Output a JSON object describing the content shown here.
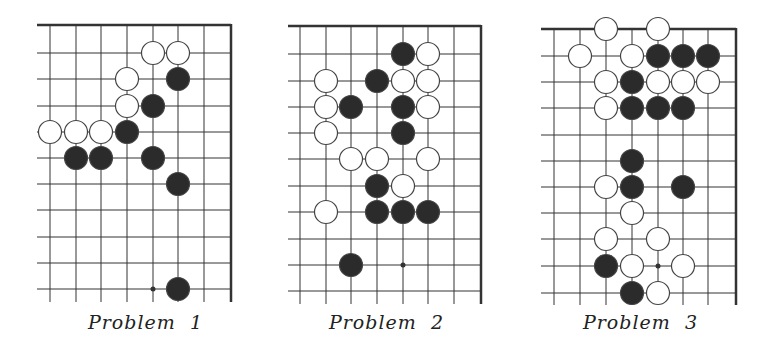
{
  "boards": [
    {
      "label": "Problem  1",
      "origin": [
        37,
        25
      ],
      "cols_x": [
        50,
        76,
        101,
        127,
        153,
        178,
        204
      ],
      "right_edge": 231,
      "rows_y": [
        25,
        53,
        79,
        106,
        132,
        158,
        184,
        210,
        237,
        263,
        289
      ],
      "bottom": 302,
      "top_row_is_edge": true,
      "white": [
        [
          4,
          1
        ],
        [
          5,
          1
        ],
        [
          3,
          2
        ],
        [
          3,
          3
        ],
        [
          0,
          4
        ],
        [
          1,
          4
        ],
        [
          2,
          4
        ]
      ],
      "black": [
        [
          5,
          2
        ],
        [
          4,
          3
        ],
        [
          3,
          4
        ],
        [
          1,
          5
        ],
        [
          2,
          5
        ],
        [
          4,
          5
        ],
        [
          5,
          6
        ],
        [
          5,
          10
        ]
      ],
      "dots": [
        [
          4,
          10
        ]
      ],
      "label_pos": [
        88,
        311
      ]
    },
    {
      "label": "Problem  2",
      "origin": [
        288,
        26
      ],
      "cols_x": [
        300,
        326,
        351,
        377,
        403,
        428,
        454
      ],
      "right_edge": 481,
      "rows_y": [
        26,
        54,
        81,
        107,
        133,
        159,
        186,
        212,
        239,
        265,
        291
      ],
      "bottom": 304,
      "top_row_is_edge": true,
      "white": [
        [
          5,
          1
        ],
        [
          1,
          2
        ],
        [
          4,
          2
        ],
        [
          5,
          2
        ],
        [
          1,
          3
        ],
        [
          5,
          3
        ],
        [
          1,
          4
        ],
        [
          2,
          5
        ],
        [
          3,
          5
        ],
        [
          5,
          5
        ],
        [
          4,
          6
        ],
        [
          1,
          7
        ]
      ],
      "black": [
        [
          4,
          1
        ],
        [
          3,
          2
        ],
        [
          2,
          3
        ],
        [
          4,
          3
        ],
        [
          4,
          4
        ],
        [
          3,
          6
        ],
        [
          3,
          7
        ],
        [
          4,
          7
        ],
        [
          5,
          7
        ],
        [
          2,
          9
        ]
      ],
      "dots": [
        [
          4,
          9
        ]
      ],
      "label_pos": [
        329,
        311
      ]
    },
    {
      "label": "Problem  3",
      "origin": [
        541,
        29
      ],
      "cols_x": [
        554,
        580,
        606,
        632,
        658,
        683,
        708
      ],
      "right_edge": 736,
      "rows_y": [
        29,
        56,
        82,
        108,
        135,
        161,
        187,
        213,
        239,
        266,
        293
      ],
      "bottom": 305,
      "top_row_is_edge": true,
      "white": [
        [
          2,
          0
        ],
        [
          4,
          0
        ],
        [
          1,
          1
        ],
        [
          3,
          1
        ],
        [
          2,
          2
        ],
        [
          4,
          2
        ],
        [
          5,
          2
        ],
        [
          6,
          2
        ],
        [
          2,
          3
        ],
        [
          2,
          6
        ],
        [
          3,
          7
        ],
        [
          2,
          8
        ],
        [
          4,
          8
        ],
        [
          3,
          9
        ],
        [
          5,
          9
        ],
        [
          4,
          10
        ]
      ],
      "black": [
        [
          4,
          1
        ],
        [
          5,
          1
        ],
        [
          6,
          1
        ],
        [
          3,
          2
        ],
        [
          3,
          3
        ],
        [
          4,
          3
        ],
        [
          5,
          3
        ],
        [
          3,
          5
        ],
        [
          3,
          6
        ],
        [
          5,
          6
        ],
        [
          2,
          9
        ],
        [
          3,
          10
        ]
      ],
      "dots": [
        [
          4,
          9
        ]
      ],
      "label_pos": [
        583,
        311
      ]
    }
  ],
  "colors": {
    "line": "#333333",
    "black_stone": "#2b2b2b",
    "white_stone": "#ffffff",
    "stone_outline": "#444444"
  },
  "stone_radius": 11.5
}
